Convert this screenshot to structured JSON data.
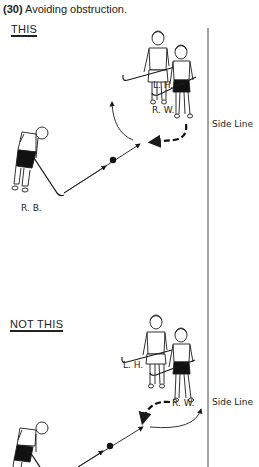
{
  "caption": {
    "number": "(30)",
    "text": "Avoiding obstruction."
  },
  "panels": [
    {
      "label": "THIS",
      "players": {
        "left_half": "L. H.",
        "right_wing": "R. W.",
        "right_back": "R. B."
      },
      "side_line": "Side Line"
    },
    {
      "label": "NOT THIS",
      "players": {
        "left_half": "L. H.",
        "right_wing": "R. W."
      },
      "side_line": "Side Line"
    }
  ],
  "colors": {
    "ink": "#1a1a1a",
    "paper": "#ffffff"
  }
}
